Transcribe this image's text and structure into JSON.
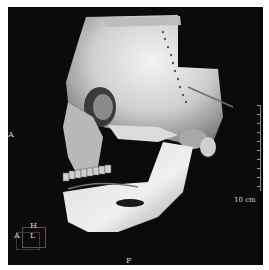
{
  "viewer": {
    "type": "3D volume rendering",
    "background_color": "#0b0b0b",
    "bone_color": "#e6e6e6"
  },
  "orientation": {
    "left_label": "A",
    "bottom_label": "F",
    "cube": {
      "top": "H",
      "left": "A",
      "front": "L"
    }
  },
  "scale_bar": {
    "label": "10 cm",
    "ticks": 10
  }
}
